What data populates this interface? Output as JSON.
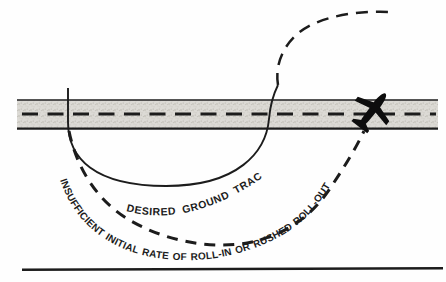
{
  "figure": {
    "type": "flight-maneuver-ground-track-diagram",
    "labels": {
      "desired_track": "DESIRED GROUND TRACK",
      "error_track": "INSUFFICIENT INITIAL RATE OF ROLL-IN OR RUSHED ROLL-OUT"
    },
    "airplane": {
      "symbol": "banked-airplane-silhouette",
      "position": "crossing road at an angle, right side",
      "heading": "northeast"
    },
    "road": {
      "style": "stippled strip with dashed centerline",
      "orientation": "horizontal"
    },
    "colors": {
      "ink": "#1c1c1c",
      "road_fill": "#dcdad5",
      "background": "#fefefe"
    }
  }
}
